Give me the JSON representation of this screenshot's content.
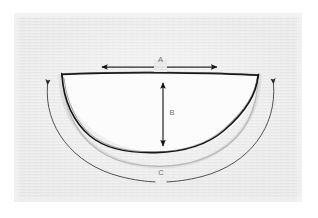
{
  "figure": {
    "background_color": "#ffffff",
    "plate_color": "#ebebeb",
    "plate_texture": "horizontal scan-line paper grain",
    "ink_color": "#1a1a1a",
    "cavity_fill": "#fcfcfc",
    "label_color": "#6e6e6e"
  },
  "labels": {
    "a": "A",
    "b": "B",
    "c": "C"
  },
  "dimensions": [
    {
      "id": "a",
      "label": "A",
      "kind": "straight-double-arrow",
      "orientation": "horizontal",
      "meaning": "rim width across the top opening",
      "from": [
        97,
        67
      ],
      "to": [
        222,
        67
      ]
    },
    {
      "id": "b",
      "label": "B",
      "kind": "straight-double-arrow",
      "orientation": "vertical",
      "meaning": "interior depth from rim to base",
      "from": [
        163,
        78
      ],
      "to": [
        163,
        151
      ]
    },
    {
      "id": "c",
      "label": "C",
      "kind": "curved-double-arrow",
      "orientation": "arc",
      "meaning": "outer circumferential arc length",
      "from": [
        45,
        79
      ],
      "to": [
        276,
        78
      ]
    }
  ],
  "shape": {
    "name": "bowl-cross-section",
    "rim_left": [
      62,
      74
    ],
    "rim_right": [
      258,
      75
    ],
    "inner_bottom": [
      160,
      152
    ],
    "outer_bottom": [
      160,
      163
    ],
    "wall_style": "hand-drawn ink outline with uneven thickness"
  }
}
